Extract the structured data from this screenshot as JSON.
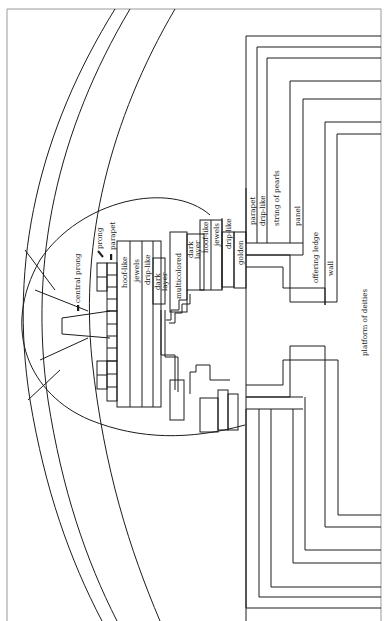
{
  "diagram": {
    "orientation": "rotated 90° counter-clockwise; labels read bottom-to-top",
    "colors": {
      "line": "#1c1c1c",
      "frame": "#9a9a9a",
      "background": "#ffffff"
    },
    "labels": {
      "central_prong": "central prong",
      "prong": "prong",
      "parapet_top": "parapet",
      "hoof_like_1": "hoof-like",
      "jewels_1": "jewels",
      "drip_like_1": "drip-like",
      "dark_layer_1": "dark layer",
      "multicolored": "multicolored",
      "dark_layer_2": "dark layer",
      "hoof_like_2": "hoof-like",
      "jewels_2": "jewels",
      "drip_like_2": "drip-like",
      "golden": "golden",
      "parapet_wall": "parapet",
      "drip_like_wall": "drip-like",
      "string_of_pearls": "string of pearls",
      "panel": "panel",
      "offering_ledge": "offering ledge",
      "wall": "wall",
      "platform_of_deities": "platform of deities"
    }
  }
}
